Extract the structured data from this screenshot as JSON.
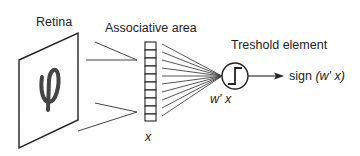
{
  "diagram": {
    "labels": {
      "retina": "Retina",
      "associative_area": "Associative area",
      "threshold_element": "Treshold element",
      "input_vector": "x",
      "weighted_sum": "w' x",
      "output_prefix": "sign",
      "output_arg": "(w' x)"
    },
    "retina_symbol": "φ",
    "associative_cells": 10,
    "fan_lines": 10,
    "threshold_icon": "step-function-icon",
    "colors": {
      "stroke": "#222222",
      "glyph": "#444444",
      "background": "#ffffff"
    }
  }
}
